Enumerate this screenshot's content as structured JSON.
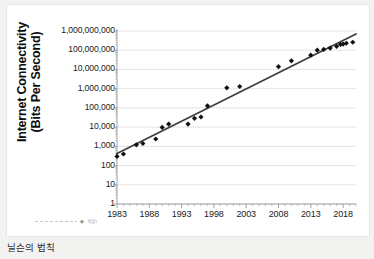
{
  "caption": "닐슨의 법칙",
  "chart_data": {
    "type": "scatter",
    "title": "",
    "xlabel": "",
    "ylabel": "Internet Connectivity (Bits Per Second)",
    "ylabel_line1": "Internet Connectivity",
    "ylabel_line2": "(Bits Per Second)",
    "xlim": [
      1983,
      2020
    ],
    "ylim": [
      1,
      1000000000
    ],
    "yscale": "log",
    "grid": true,
    "grid_axis": "y",
    "legend": "",
    "x_ticks": [
      "1983",
      "1988",
      "1993",
      "1998",
      "2003",
      "2008",
      "2013",
      "2018"
    ],
    "x_tick_values": [
      1983,
      1988,
      1993,
      1998,
      2003,
      2008,
      2013,
      2018
    ],
    "x_minor_tick_interval": 1,
    "y_ticks": [
      "1",
      "10",
      "100",
      "1,000",
      "10,000",
      "100,000",
      "1,000,000",
      "10,000,000",
      "100,000,000",
      "1,000,000,000"
    ],
    "y_tick_values": [
      1,
      10,
      100,
      1000,
      10000,
      100000,
      1000000,
      10000000,
      100000000,
      1000000000
    ],
    "points": [
      {
        "x": 1983,
        "y": 300
      },
      {
        "x": 1984,
        "y": 400
      },
      {
        "x": 1986,
        "y": 1200
      },
      {
        "x": 1987,
        "y": 1400
      },
      {
        "x": 1989,
        "y": 2400
      },
      {
        "x": 1990,
        "y": 9600
      },
      {
        "x": 1991,
        "y": 14400
      },
      {
        "x": 1994,
        "y": 14400
      },
      {
        "x": 1995,
        "y": 28800
      },
      {
        "x": 1996,
        "y": 33600
      },
      {
        "x": 1997,
        "y": 128000
      },
      {
        "x": 2000,
        "y": 1100000
      },
      {
        "x": 2002,
        "y": 1300000
      },
      {
        "x": 2008,
        "y": 14000000
      },
      {
        "x": 2010,
        "y": 28000000
      },
      {
        "x": 2013,
        "y": 55000000
      },
      {
        "x": 2014,
        "y": 100000000
      },
      {
        "x": 2015,
        "y": 110000000
      },
      {
        "x": 2016,
        "y": 130000000
      },
      {
        "x": 2017,
        "y": 160000000
      },
      {
        "x": 2017.6,
        "y": 200000000
      },
      {
        "x": 2018,
        "y": 210000000
      },
      {
        "x": 2018.5,
        "y": 230000000
      },
      {
        "x": 2019.5,
        "y": 260000000
      }
    ],
    "trendline": {
      "label": "exponential fit",
      "start": {
        "x": 1983,
        "y": 420
      },
      "end": {
        "x": 2020,
        "y": 700000000
      }
    },
    "colors": {
      "marker": "#111111",
      "trendline": "#3d3d3d",
      "grid": "#d9d9d9",
      "axis": "#9a9a9a",
      "background": "#ffffff",
      "page": "#f2f2f0",
      "text": "#1a1a1a"
    }
  },
  "legend": {
    "series_label": "계열1"
  }
}
